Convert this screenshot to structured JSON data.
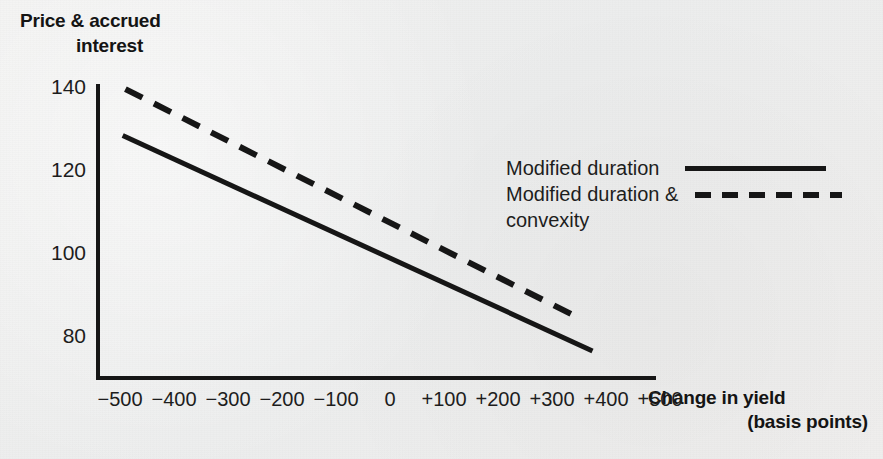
{
  "chart_data": {
    "type": "line",
    "title": "",
    "ylabel_line1": "Price & accrued",
    "ylabel_line2": "interest",
    "xlabel_line1": "Change in yield",
    "xlabel_line2": "(basis points)",
    "x": [
      -500,
      -400,
      -300,
      -200,
      -100,
      0,
      100,
      200,
      300,
      400,
      500
    ],
    "xtick_labels": [
      "−500",
      "−400",
      "−300",
      "−200",
      "−100",
      "0",
      "+100",
      "+200",
      "+300",
      "+400",
      "+500"
    ],
    "ytick_labels": [
      "140",
      "120",
      "100",
      "80"
    ],
    "ytick_values": [
      140,
      120,
      100,
      80
    ],
    "xlim": [
      -520,
      520
    ],
    "ylim": [
      72,
      143
    ],
    "grid": false,
    "legend_position": "center-right",
    "series": [
      {
        "name": "Modified duration",
        "style": "solid",
        "color": "#161616",
        "x": [
          -495,
          375
        ],
        "values": [
          128.3,
          76.4
        ]
      },
      {
        "name": "Modified duration & convexity",
        "style": "dashed",
        "color": "#161616",
        "x": [
          -490,
          355
        ],
        "values": [
          139.5,
          84.0
        ]
      }
    ]
  },
  "legend": {
    "items": [
      {
        "label": "Modified duration",
        "sub": "",
        "style": "solid"
      },
      {
        "label": "Modified duration &",
        "sub": "convexity",
        "style": "dashed"
      }
    ]
  },
  "colors": {
    "ink": "#161616",
    "text": "#1d1d1d",
    "background": "#eeeeee"
  }
}
